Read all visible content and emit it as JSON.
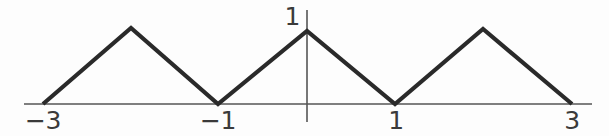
{
  "figure": {
    "background_color": "#fdfdfd",
    "curve_color": "#2a2a2a",
    "axis_color": "#555555",
    "label_color": "#3a3a3a"
  },
  "axis_labels": {
    "x_ticks": [
      {
        "text": "−3",
        "value": -3,
        "px": 43
      },
      {
        "text": "−1",
        "value": -1,
        "px": 218
      },
      {
        "text": "1",
        "value": 1,
        "px": 395
      },
      {
        "text": "3",
        "value": 3,
        "px": 572
      }
    ],
    "y_ticks": [
      {
        "text": "1",
        "value": 1,
        "px": 302
      }
    ]
  },
  "chart_data": {
    "type": "line",
    "title": "",
    "subtitle": "",
    "xlabel": "",
    "ylabel": "",
    "legend": [],
    "grid": false,
    "xlim": [
      -3,
      3
    ],
    "ylim": [
      0,
      1
    ],
    "x_tick_labels": [
      "−3",
      "−1",
      "1",
      "3"
    ],
    "x_tick_values": [
      -3,
      -1,
      1,
      3
    ],
    "y_tick_labels": [
      "1"
    ],
    "y_tick_values": [
      1
    ],
    "series": [
      {
        "name": "triangle-wave",
        "color": "#2a2a2a",
        "line_width": 4,
        "x": [
          -3,
          -2,
          -1,
          0,
          1,
          2,
          3
        ],
        "y": [
          0,
          1,
          0,
          1,
          0,
          1,
          0
        ],
        "points_px": [
          {
            "x": 43,
            "y": 104
          },
          {
            "x": 131,
            "y": 28
          },
          {
            "x": 218,
            "y": 104
          },
          {
            "x": 307,
            "y": 31
          },
          {
            "x": 395,
            "y": 104
          },
          {
            "x": 483,
            "y": 29
          },
          {
            "x": 572,
            "y": 104
          }
        ]
      }
    ],
    "axes": {
      "x_axis": {
        "y_px": 104,
        "x_start_px": 24,
        "x_end_px": 592,
        "color": "#555555",
        "width": 1.6
      },
      "y_axis": {
        "x_px": 307,
        "y_start_px": 10,
        "y_end_px": 122,
        "color": "#555555",
        "width": 1.6
      }
    }
  }
}
